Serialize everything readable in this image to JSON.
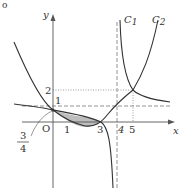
{
  "figure": {
    "corner_mark": "o",
    "axes": {
      "x_label": "x",
      "y_label": "y",
      "origin_label": "O",
      "x_ticks": [
        "1",
        "3",
        "4",
        "5"
      ],
      "y_ticks": [
        "1",
        "2"
      ]
    },
    "curves": [
      {
        "name": "C1",
        "label_main": "C",
        "label_sub": "1",
        "equation": "y = 1 + 1/(x-4)"
      },
      {
        "name": "C2",
        "label_main": "C",
        "label_sub": "2",
        "equation": "y = (x-1)(x-3)/4"
      }
    ],
    "annotations": {
      "fraction_numerator": "3",
      "fraction_denominator": "4"
    },
    "asymptotes": {
      "vertical_x": 4,
      "horizontal_y": 1
    },
    "intersections": [
      [
        0,
        0.75
      ],
      [
        3,
        0
      ],
      [
        5,
        2
      ]
    ],
    "shaded_region": {
      "from_x": 0,
      "to_x": 3,
      "between": [
        "C1",
        "C2"
      ]
    },
    "colors": {
      "curve": "#333333",
      "axis": "#555555",
      "shade": "#bdbdbd",
      "dashed": "#777777"
    }
  }
}
